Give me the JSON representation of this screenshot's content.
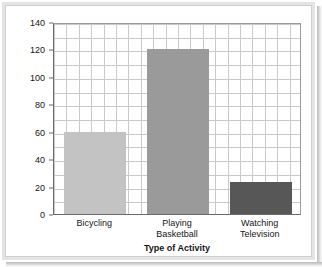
{
  "chart_data": {
    "type": "bar",
    "title": "",
    "categories": [
      "Bicycling",
      "Playing Basketball",
      "Watching Television"
    ],
    "category_lines": [
      [
        "Bicycling"
      ],
      [
        "Playing",
        "Basketball"
      ],
      [
        "Watching",
        "Television"
      ]
    ],
    "values": [
      60,
      120,
      23
    ],
    "xlabel": "Type of Activity",
    "ylabel": "Calories Burned in 30 Minutes",
    "ylim": [
      0,
      140
    ],
    "ytick_step": 20,
    "yticks": [
      0,
      20,
      40,
      60,
      80,
      100,
      120,
      140
    ],
    "ytick_labels": [
      "0",
      "20",
      "40",
      "60",
      "80",
      "100",
      "120",
      "140"
    ],
    "grid": true,
    "grid_minor_step": 10,
    "legend": "none",
    "bar_colors": [
      "#c3c3c3",
      "#9a9a9a",
      "#575757"
    ]
  },
  "colors": {
    "axis": "#6b6b6b",
    "grid": "#c9c9c9",
    "text": "#151515",
    "frame": "#e4e4e4",
    "background": "#ffffff"
  }
}
